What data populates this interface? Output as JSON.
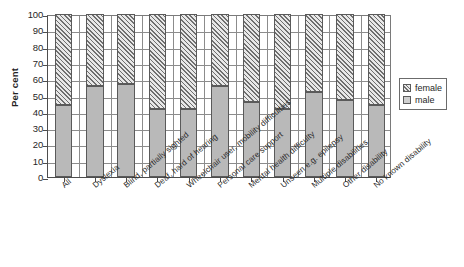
{
  "chart_data": {
    "type": "bar",
    "subtype": "stacked-percentage",
    "title": "",
    "xlabel": "",
    "ylabel": "Per cent",
    "ylim": [
      0,
      100
    ],
    "ytick_step": 10,
    "yticks": [
      100,
      90,
      80,
      70,
      60,
      50,
      40,
      30,
      20,
      10,
      0
    ],
    "grid": true,
    "grid_axis": "both",
    "legend_position": "right",
    "categories": [
      "All",
      "Dyslexia",
      "Blind, partially sighted",
      "Deaf, hard of hearing",
      "Wheelchair user, mobility difficulties",
      "Personal care support",
      "Mental health difficulty",
      "Unseen e.g. epilepsy",
      "Multiple disabilities",
      "Other disability",
      "No known disability"
    ],
    "series": [
      {
        "name": "male",
        "values": [
          44,
          56,
          57,
          42,
          42,
          56,
          46,
          42,
          52,
          47,
          44
        ]
      },
      {
        "name": "female",
        "values": [
          56,
          44,
          43,
          58,
          58,
          44,
          54,
          58,
          48,
          53,
          56
        ]
      }
    ]
  },
  "legend": {
    "items": [
      {
        "label": "female",
        "swatch": "hatched-diagonal"
      },
      {
        "label": "male",
        "swatch": "solid-gray"
      }
    ]
  },
  "colors": {
    "male_fill": "#b9b9b9",
    "female_fill": "#e8e8e8",
    "hatch": "#6f6f6f",
    "outline": "#5a5a5a",
    "grid": "#8c8c8c",
    "axis": "#4d4d4d",
    "background": "#ffffff"
  }
}
